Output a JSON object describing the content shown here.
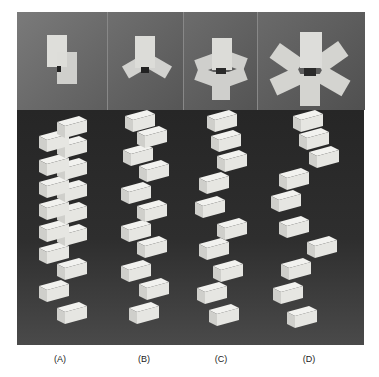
{
  "figure": {
    "panels": [
      {
        "id": "A",
        "label": "(A)",
        "top_view_blocks": 2
      },
      {
        "id": "B",
        "label": "(B)",
        "top_view_blocks": 3
      },
      {
        "id": "C",
        "label": "(C)",
        "top_view_blocks": 4
      },
      {
        "id": "D",
        "label": "(D)",
        "top_view_blocks": 6
      }
    ]
  },
  "colors": {
    "block": "#e9e9e6",
    "block_shade": "#c4c4c0",
    "top_bg": "#6e6e6e",
    "bottom_bg": "#2c2c2c"
  }
}
